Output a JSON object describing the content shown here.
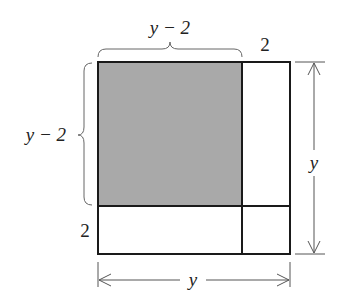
{
  "diagram": {
    "colors": {
      "shade": "#a9a9a9",
      "line": "#1a1a1a",
      "dimension": "#555555",
      "background": "#ffffff"
    },
    "labels": {
      "top_brace": "y − 2",
      "top_right": "2",
      "left_brace": "y − 2",
      "left_bottom": "2",
      "right_dimension": "y",
      "bottom_dimension": "y"
    },
    "regions": [
      {
        "name": "shaded-square",
        "width": "y − 2",
        "height": "y − 2",
        "shaded": true
      },
      {
        "name": "right-strip",
        "width": "2",
        "height": "y − 2",
        "shaded": false
      },
      {
        "name": "bottom-strip",
        "width": "y − 2",
        "height": "2",
        "shaded": false
      },
      {
        "name": "corner-square",
        "width": "2",
        "height": "2",
        "shaded": false
      }
    ]
  }
}
